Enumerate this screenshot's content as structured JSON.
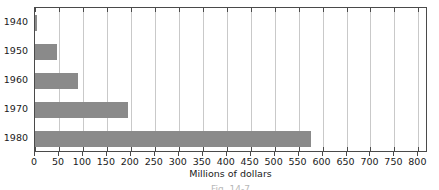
{
  "chart_data": {
    "type": "bar",
    "orientation": "horizontal",
    "title": "",
    "subtitle": "",
    "xlabel": "Millions of dollars",
    "ylabel": "",
    "categories": [
      "1940",
      "1950",
      "1960",
      "1970",
      "1980"
    ],
    "values": [
      5,
      45,
      90,
      195,
      575
    ],
    "series": [
      {
        "name": "Millions of dollars",
        "values": [
          5,
          45,
          90,
          195,
          575
        ]
      }
    ],
    "xlim": [
      0,
      820
    ],
    "ylim": null,
    "x_ticks": [
      0,
      50,
      100,
      150,
      200,
      250,
      300,
      350,
      400,
      450,
      500,
      550,
      600,
      650,
      700,
      750,
      800
    ],
    "x_tick_labels": [
      "0",
      "50",
      "100",
      "150",
      "200",
      "250",
      "300",
      "350",
      "400",
      "450",
      "500",
      "550",
      "600",
      "650",
      "700",
      "750",
      "800"
    ],
    "y_tick_labels": [
      "1940",
      "1950",
      "1960",
      "1970",
      "1980"
    ],
    "grid": "vertical",
    "legend": null,
    "legend_position": "none",
    "annotations": [],
    "colors": {
      "bar": "#8a8a8a",
      "gridline": "#c9c9c9",
      "axis": "#4a4a4a",
      "text": "#1a1a1a",
      "background": "#ffffff"
    }
  },
  "caption": {
    "text": "Fig. 14-7"
  }
}
